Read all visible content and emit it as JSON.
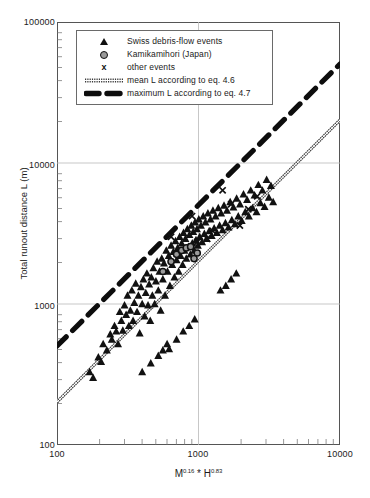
{
  "chart_data": {
    "type": "scatter",
    "title": "",
    "xlabel": "M^0.16 * H^0.83",
    "xlabel_parts": {
      "base1": "M",
      "exp1": "0.16",
      "operator": " * ",
      "base2": "H",
      "exp2": "0.83"
    },
    "ylabel": "Total runout distance L (m)",
    "xscale": "log",
    "yscale": "log",
    "xlim": [
      100,
      10000
    ],
    "ylim": [
      100,
      100000
    ],
    "xticks": [
      100,
      1000,
      10000
    ],
    "xticklabels": [
      "100",
      "1000",
      "10000"
    ],
    "yticks": [
      100,
      1000,
      10000,
      100000
    ],
    "yticklabels": [
      "100",
      "1000",
      "10000",
      "100000"
    ],
    "grid": "major-only",
    "legend_position": "top-left-inside",
    "series": [
      {
        "name": "Swiss debris-flow events",
        "marker": "triangle",
        "color": "#111111",
        "points": [
          [
            170,
            330
          ],
          [
            180,
            300
          ],
          [
            196,
            420
          ],
          [
            205,
            390
          ],
          [
            212,
            520
          ],
          [
            225,
            470
          ],
          [
            238,
            610
          ],
          [
            244,
            560
          ],
          [
            255,
            700
          ],
          [
            262,
            640
          ],
          [
            270,
            520
          ],
          [
            278,
            880
          ],
          [
            285,
            760
          ],
          [
            292,
            650
          ],
          [
            300,
            980
          ],
          [
            308,
            840
          ],
          [
            315,
            1150
          ],
          [
            322,
            700
          ],
          [
            330,
            900
          ],
          [
            338,
            1250
          ],
          [
            345,
            760
          ],
          [
            352,
            1020
          ],
          [
            360,
            1400
          ],
          [
            368,
            880
          ],
          [
            376,
            1150
          ],
          [
            384,
            620
          ],
          [
            392,
            1320
          ],
          [
            400,
            1000
          ],
          [
            408,
            1500
          ],
          [
            416,
            820
          ],
          [
            424,
            1200
          ],
          [
            432,
            1650
          ],
          [
            440,
            980
          ],
          [
            448,
            1380
          ],
          [
            456,
            760
          ],
          [
            464,
            1550
          ],
          [
            472,
            1150
          ],
          [
            480,
            1800
          ],
          [
            490,
            1000
          ],
          [
            500,
            1450
          ],
          [
            510,
            2000
          ],
          [
            520,
            1250
          ],
          [
            530,
            1700
          ],
          [
            540,
            900
          ],
          [
            550,
            2100
          ],
          [
            560,
            1500
          ],
          [
            570,
            1950
          ],
          [
            580,
            1150
          ],
          [
            592,
            2400
          ],
          [
            604,
            1700
          ],
          [
            616,
            2200
          ],
          [
            628,
            1350
          ],
          [
            640,
            2600
          ],
          [
            652,
            1900
          ],
          [
            664,
            2350
          ],
          [
            676,
            1550
          ],
          [
            688,
            2800
          ],
          [
            700,
            2050
          ],
          [
            712,
            2500
          ],
          [
            724,
            1700
          ],
          [
            736,
            3000
          ],
          [
            748,
            2200
          ],
          [
            760,
            2700
          ],
          [
            772,
            1900
          ],
          [
            784,
            3200
          ],
          [
            796,
            2400
          ],
          [
            808,
            2900
          ],
          [
            820,
            2100
          ],
          [
            834,
            3400
          ],
          [
            848,
            2550
          ],
          [
            862,
            3100
          ],
          [
            876,
            2250
          ],
          [
            890,
            3600
          ],
          [
            904,
            2700
          ],
          [
            918,
            3250
          ],
          [
            932,
            2400
          ],
          [
            946,
            3800
          ],
          [
            960,
            2850
          ],
          [
            975,
            3400
          ],
          [
            990,
            2600
          ],
          [
            1005,
            4000
          ],
          [
            1020,
            3000
          ],
          [
            1040,
            3600
          ],
          [
            1060,
            2750
          ],
          [
            1080,
            4200
          ],
          [
            1100,
            3150
          ],
          [
            1120,
            3800
          ],
          [
            1140,
            2900
          ],
          [
            1165,
            4400
          ],
          [
            1190,
            3300
          ],
          [
            1215,
            4000
          ],
          [
            1240,
            3050
          ],
          [
            1265,
            4600
          ],
          [
            1290,
            3450
          ],
          [
            1320,
            4200
          ],
          [
            1350,
            3200
          ],
          [
            1380,
            4800
          ],
          [
            1410,
            3600
          ],
          [
            1445,
            4400
          ],
          [
            1480,
            3350
          ],
          [
            1515,
            5000
          ],
          [
            1550,
            3750
          ],
          [
            1590,
            4600
          ],
          [
            1630,
            3500
          ],
          [
            1675,
            5300
          ],
          [
            1720,
            3950
          ],
          [
            1765,
            4850
          ],
          [
            1810,
            3700
          ],
          [
            1860,
            5600
          ],
          [
            1910,
            4200
          ],
          [
            1965,
            5100
          ],
          [
            2020,
            3900
          ],
          [
            2080,
            6000
          ],
          [
            2140,
            4500
          ],
          [
            2205,
            5500
          ],
          [
            2270,
            4200
          ],
          [
            2340,
            6400
          ],
          [
            2410,
            4800
          ],
          [
            2490,
            5900
          ],
          [
            2570,
            4500
          ],
          [
            2650,
            7000
          ],
          [
            2740,
            5200
          ],
          [
            2830,
            6400
          ],
          [
            2930,
            4900
          ],
          [
            3030,
            7600
          ],
          [
            3140,
            5700
          ],
          [
            3250,
            6900
          ],
          [
            3370,
            5300
          ],
          [
            620,
            480
          ],
          [
            700,
            560
          ],
          [
            780,
            640
          ],
          [
            860,
            700
          ],
          [
            940,
            780
          ],
          [
            400,
            330
          ],
          [
            460,
            380
          ],
          [
            520,
            430
          ],
          [
            560,
            470
          ],
          [
            600,
            520
          ],
          [
            1430,
            1250
          ],
          [
            1560,
            1350
          ],
          [
            1700,
            1500
          ],
          [
            1850,
            1650
          ]
        ]
      },
      {
        "name": "Kamikamihori (Japan)",
        "marker": "circle",
        "color": "#9a9a9a",
        "edgecolor": "#111111",
        "points": [
          [
            560,
            1700
          ],
          [
            640,
            2000
          ],
          [
            700,
            2250
          ],
          [
            760,
            2400
          ],
          [
            820,
            2500
          ],
          [
            880,
            2550
          ],
          [
            930,
            2100
          ],
          [
            980,
            2300
          ]
        ]
      },
      {
        "name": "other events",
        "marker": "x",
        "color": "#111111",
        "points": [
          [
            640,
            3000
          ],
          [
            900,
            4200
          ],
          [
            1150,
            2900
          ],
          [
            1480,
            6400
          ],
          [
            1700,
            5100
          ],
          [
            1960,
            3600
          ],
          [
            2250,
            4700
          ],
          [
            980,
            2750
          ],
          [
            1260,
            3300
          ],
          [
            2600,
            5800
          ]
        ]
      }
    ],
    "lines": [
      {
        "name": "mean L according to eq. 4.6",
        "style": "thin-double-hatched",
        "color": "#3a3a3a",
        "x": [
          100,
          10000
        ],
        "y": [
          200,
          20000
        ]
      },
      {
        "name": "maximum L according to eq. 4.7",
        "style": "thick-dashed",
        "color": "#111111",
        "x": [
          100,
          10000
        ],
        "y": [
          500,
          50000
        ]
      }
    ],
    "legend": [
      {
        "label": "Swiss debris-flow events",
        "key": "triangle-marker"
      },
      {
        "label": "Kamikamihori (Japan)",
        "key": "circle-marker"
      },
      {
        "label": "other events",
        "key": "x-marker"
      },
      {
        "label": "mean L  according to eq. 4.6",
        "key": "thin-hatched-line"
      },
      {
        "label": "maximum L according to eq. 4.7",
        "key": "thick-dashed-line"
      }
    ]
  }
}
